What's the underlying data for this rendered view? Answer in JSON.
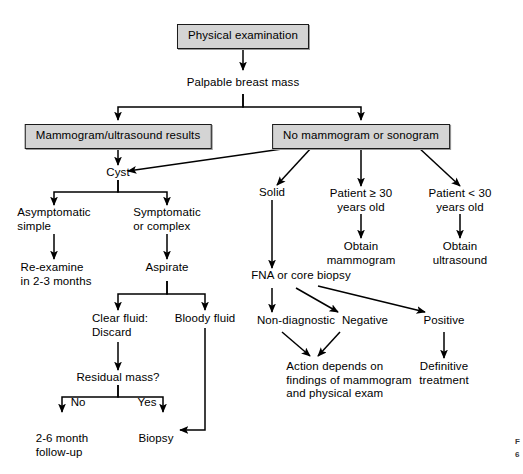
{
  "figure": {
    "background_color": "#ffffff",
    "box_fill_color": "#d4d4d4",
    "box_border_color": "#1a1a1a",
    "line_color": "#000000"
  },
  "nodes": {
    "physical_examination": "Physical examination",
    "palpable_breast_mass": "Palpable breast mass",
    "mammogram_ultrasound_results": "Mammogram/ultrasound results",
    "no_mammogram_or_sonogram": "No mammogram or sonogram",
    "cyst": "Cyst",
    "solid": "Solid",
    "patient_ge_30": "Patient ≥ 30\nyears old",
    "patient_lt_30": "Patient < 30\nyears old",
    "obtain_mammogram": "Obtain\nmammogram",
    "obtain_ultrasound": "Obtain\nultrasound",
    "asymptomatic_simple": "Asymptomatic\nsimple",
    "symptomatic_or_complex": "Symptomatic\nor complex",
    "re_examine": "Re-examine\nin 2-3 months",
    "aspirate": "Aspirate",
    "fna_or_core_biopsy": "FNA or core biopsy",
    "clear_fluid_discard": "Clear fluid:\nDiscard",
    "bloody_fluid": "Bloody fluid",
    "residual_mass": "Residual mass?",
    "follow_up": "2-6 month\nfollow-up",
    "biopsy": "Biopsy",
    "non_diagnostic": "Non-diagnostic",
    "negative": "Negative",
    "positive": "Positive",
    "action_depends": "Action depends on\nfindings of mammogram\nand physical exam",
    "definitive_treatment": "Definitive\ntreatment"
  },
  "edge_labels": {
    "no": "No",
    "yes": "Yes"
  },
  "caption": {
    "line1": "F",
    "line2": "6"
  }
}
